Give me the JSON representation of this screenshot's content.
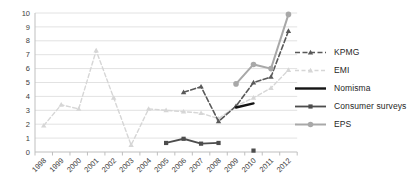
{
  "chart_data": {
    "type": "line",
    "title": "",
    "xlabel": "",
    "ylabel": "",
    "ylim": [
      0,
      10
    ],
    "ytick_step": 1,
    "y_ticks": [
      "0",
      "1",
      "2",
      "3",
      "4",
      "5",
      "6",
      "7",
      "8",
      "9",
      "10"
    ],
    "grid": "horizontal",
    "x_axis_label_rotation": -45,
    "legend_position": "right",
    "categories": [
      "1998",
      "1999",
      "2000",
      "2001",
      "2002",
      "2003",
      "2004",
      "2005",
      "2006",
      "2007",
      "2008",
      "2009",
      "2010",
      "2011",
      "2012"
    ],
    "series": [
      {
        "name": "EMI",
        "color": "#d6d6d6",
        "line_style": "dashed",
        "marker": "triangle",
        "width": 1.4,
        "values": [
          1.9,
          3.4,
          3.1,
          7.3,
          3.9,
          0.5,
          3.1,
          3.0,
          2.9,
          2.8,
          2.4,
          3.3,
          3.9,
          4.6,
          5.9
        ]
      },
      {
        "name": "KPMG",
        "color": "#595959",
        "line_style": "dashed",
        "marker": "triangle",
        "width": 1.6,
        "values": [
          null,
          null,
          null,
          null,
          null,
          null,
          null,
          null,
          4.3,
          4.7,
          2.2,
          3.3,
          5.0,
          5.4,
          8.7
        ]
      },
      {
        "name": "Nomisma",
        "color": "#141414",
        "line_style": "solid",
        "marker": "none",
        "width": 2.4,
        "values": [
          null,
          null,
          null,
          null,
          null,
          null,
          null,
          null,
          null,
          null,
          null,
          3.2,
          3.5,
          null,
          null
        ]
      },
      {
        "name": "Consumer surveys",
        "color": "#4d4d4d",
        "line_style": "solid",
        "marker": "square",
        "width": 1.8,
        "values": [
          null,
          null,
          null,
          null,
          null,
          null,
          null,
          0.65,
          0.95,
          0.6,
          0.65,
          null,
          0.1,
          null,
          null
        ]
      },
      {
        "name": "EPS",
        "color": "#a8a8a8",
        "line_style": "solid",
        "marker": "circle",
        "width": 2.0,
        "values": [
          null,
          null,
          null,
          null,
          null,
          null,
          null,
          null,
          null,
          null,
          null,
          4.9,
          6.3,
          6.0,
          9.9
        ]
      }
    ],
    "legend_order": [
      "KPMG",
      "EMI",
      "Nomisma",
      "Consumer surveys",
      "EPS"
    ]
  },
  "colors": {
    "background": "#ffffff",
    "gridline": "#e2e2e2",
    "axis": "#bfbfbf",
    "tick_label": "#3d3d3d",
    "legend_text": "#262626"
  }
}
